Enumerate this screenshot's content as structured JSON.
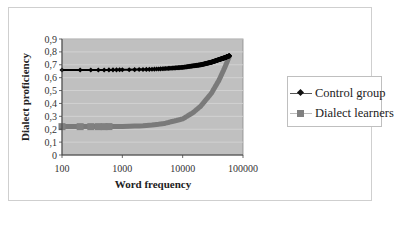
{
  "chart_data": {
    "type": "line",
    "title": "",
    "xlabel": "Word frequency",
    "ylabel": "Dialect  proficiency",
    "x_scale": "log",
    "xlim": [
      100,
      100000
    ],
    "ylim": [
      0,
      0.9
    ],
    "x_ticks": [
      "100",
      "1000",
      "10000",
      "100000"
    ],
    "y_ticks": [
      "0",
      "0,1",
      "0,2",
      "0,3",
      "0,4",
      "0,5",
      "0,6",
      "0,7",
      "0,8",
      "0,9"
    ],
    "grid": true,
    "legend_position": "right",
    "plot_background": "#c0c0c0",
    "series": [
      {
        "name": "Control group",
        "color": "#000000",
        "marker": "diamond",
        "x": [
          100,
          200,
          300,
          500,
          1000,
          2000,
          3000,
          5000,
          10000,
          20000,
          30000,
          40000,
          50000,
          60000
        ],
        "y": [
          0.66,
          0.66,
          0.66,
          0.66,
          0.661,
          0.663,
          0.665,
          0.67,
          0.68,
          0.7,
          0.72,
          0.74,
          0.755,
          0.77
        ]
      },
      {
        "name": "Dialect learners",
        "color": "#808080",
        "marker": "square",
        "x": [
          100,
          200,
          300,
          500,
          1000,
          2000,
          3000,
          5000,
          10000,
          15000,
          20000,
          30000,
          40000,
          50000,
          60000
        ],
        "y": [
          0.22,
          0.22,
          0.22,
          0.22,
          0.222,
          0.226,
          0.232,
          0.245,
          0.28,
          0.33,
          0.38,
          0.48,
          0.58,
          0.68,
          0.77
        ]
      }
    ]
  },
  "legend": {
    "items": [
      {
        "label": "Control group"
      },
      {
        "label": "Dialect learners"
      }
    ]
  }
}
